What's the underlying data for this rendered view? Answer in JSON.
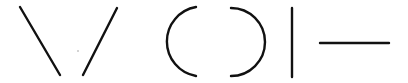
{
  "diagram": {
    "background": "#ffffff",
    "stroke_color": "#111111",
    "stroke_width": 2.4,
    "shapes": [
      {
        "name": "diagonal-line-backslash",
        "type": "line",
        "x1": 20,
        "y1": 7,
        "x2": 60,
        "y2": 75
      },
      {
        "name": "diagonal-line-slash",
        "type": "line",
        "x1": 117,
        "y1": 8,
        "x2": 83,
        "y2": 75
      },
      {
        "name": "left-arc",
        "type": "arc",
        "d": "M196,7 A35,35 0 0 0 196,76"
      },
      {
        "name": "right-arc",
        "type": "arc",
        "d": "M231,8 A34,34 0 0 1 231,76"
      },
      {
        "name": "vertical-line",
        "type": "line",
        "x1": 292,
        "y1": 8,
        "x2": 292,
        "y2": 77
      },
      {
        "name": "horizontal-line",
        "type": "line",
        "x1": 320,
        "y1": 43,
        "x2": 389,
        "y2": 43
      }
    ],
    "speck": {
      "cx": 78,
      "cy": 51,
      "r": 0.7
    }
  }
}
